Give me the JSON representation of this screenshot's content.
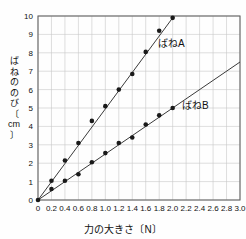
{
  "chart_data": {
    "type": "line",
    "title": "",
    "xlabel": "力の大きさ〔N〕",
    "ylabel": "ばねののび〔cm〕",
    "xlim": [
      0,
      3.0
    ],
    "ylim": [
      0,
      10
    ],
    "xticks": [
      "0",
      "0.2",
      "0.4",
      "0.6",
      "0.8",
      "1.0",
      "1.2",
      "1.4",
      "1.6",
      "1.8",
      "2.0",
      "2.2",
      "2.4",
      "2.6",
      "2.8",
      "3.0"
    ],
    "xtick_values": [
      0,
      0.2,
      0.4,
      0.6,
      0.8,
      1.0,
      1.2,
      1.4,
      1.6,
      1.8,
      2.0,
      2.2,
      2.4,
      2.6,
      2.8,
      3.0
    ],
    "yticks": [
      "0",
      "1",
      "2",
      "3",
      "4",
      "5",
      "6",
      "7",
      "8",
      "9",
      "10"
    ],
    "ytick_values": [
      0,
      1,
      2,
      3,
      4,
      5,
      6,
      7,
      8,
      9,
      10
    ],
    "grid": true,
    "legend_position": "inline-annotation",
    "marker": "filled-circle",
    "line_color": "#3a3a3a",
    "marker_color": "#1a1a1a",
    "grid_color": "#c8c8c8",
    "axis_color": "#666666",
    "series": [
      {
        "name": "ばねA",
        "label_x": 2.05,
        "label_y": 8.6,
        "x": [
          0,
          0.2,
          0.4,
          0.6,
          0.8,
          1.0,
          1.2,
          1.4,
          1.6,
          1.8,
          2.0
        ],
        "values": [
          0,
          1.05,
          2.15,
          3.1,
          4.3,
          5.1,
          6.0,
          6.85,
          8.05,
          9.2,
          9.9
        ],
        "fit_from": [
          0,
          0
        ],
        "fit_to": [
          2.0,
          9.9
        ]
      },
      {
        "name": "ばねB",
        "label_x": 2.45,
        "label_y": 5.4,
        "x": [
          0,
          0.2,
          0.4,
          0.6,
          0.8,
          1.0,
          1.2,
          1.4,
          1.6,
          1.8,
          2.0
        ],
        "values": [
          0,
          0.6,
          1.05,
          1.4,
          2.05,
          2.55,
          3.1,
          3.4,
          4.1,
          4.6,
          5.0
        ],
        "fit_from": [
          0,
          0
        ],
        "fit_to": [
          3.0,
          7.5
        ]
      }
    ]
  },
  "axis": {
    "x_title": "力の大きさ〔N〕",
    "y_title_chars": [
      "ば",
      "ね",
      "の",
      "の",
      "び",
      "〔",
      "cm",
      "〕"
    ]
  },
  "labels": {
    "series_a": "ばねA",
    "series_b": "ばねB"
  }
}
